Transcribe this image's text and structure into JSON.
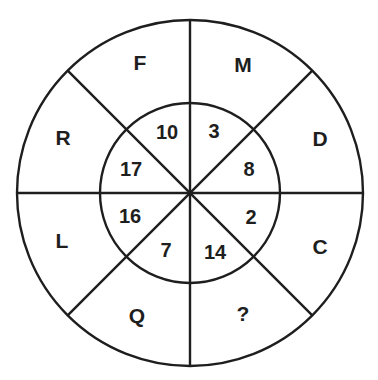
{
  "puzzle": {
    "type": "circular number-letter puzzle",
    "structure": "outer ring of 8 letter segments, inner circle of 8 number segments",
    "outer_segments": [
      {
        "position": "top-left",
        "label": "F"
      },
      {
        "position": "top-right",
        "label": "M"
      },
      {
        "position": "right-upper",
        "label": "D"
      },
      {
        "position": "right-lower",
        "label": "C"
      },
      {
        "position": "bottom-right",
        "label": "?"
      },
      {
        "position": "bottom-left",
        "label": "Q"
      },
      {
        "position": "left-lower",
        "label": "L"
      },
      {
        "position": "left-upper",
        "label": "R"
      }
    ],
    "inner_segments": [
      {
        "position": "top-left",
        "label": "10"
      },
      {
        "position": "top-right",
        "label": "3"
      },
      {
        "position": "right-upper",
        "label": "8"
      },
      {
        "position": "right-lower",
        "label": "2"
      },
      {
        "position": "bottom-right",
        "label": "14"
      },
      {
        "position": "bottom-left",
        "label": "7"
      },
      {
        "position": "left-lower",
        "label": "16"
      },
      {
        "position": "left-upper",
        "label": "17"
      }
    ],
    "colors": {
      "line": "#1e1e1e",
      "background": "#ffffff"
    }
  }
}
